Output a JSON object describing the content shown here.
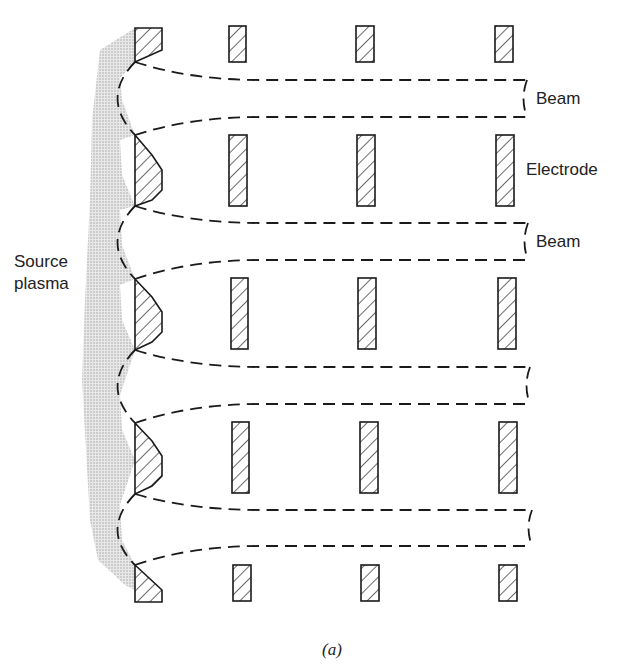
{
  "figure": {
    "caption": "(a)",
    "labels": {
      "beam_1": "Beam",
      "electrode": "Electrode",
      "beam_2": "Beam",
      "source_line1": "Source",
      "source_line2": "plasma"
    },
    "colors": {
      "line": "#1a1a1a",
      "plasma_fill": "#d6d6d6",
      "background": "#ffffff"
    },
    "electrode_columns": 4,
    "electrode_rows": 5,
    "beamlets": 4
  }
}
